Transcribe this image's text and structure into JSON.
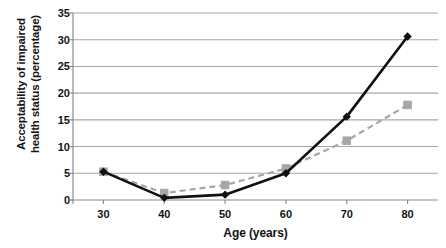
{
  "chart_data": {
    "type": "line",
    "title": "",
    "xlabel": "Age (years)",
    "ylabel_line1": "Acceptability of impaired",
    "ylabel_line2": "health status (percentage)",
    "x": [
      30,
      40,
      50,
      60,
      70,
      80
    ],
    "xticklabels": [
      "30",
      "40",
      "50",
      "60",
      "70",
      "80"
    ],
    "yticklabels": [
      "0",
      "5",
      "10",
      "15",
      "20",
      "25",
      "30",
      "35"
    ],
    "yticks": [
      0,
      5,
      10,
      15,
      20,
      25,
      30,
      35
    ],
    "xlim": [
      25,
      85
    ],
    "ylim": [
      0,
      35
    ],
    "grid": "horizontal",
    "legend": "none",
    "series": [
      {
        "name": "black-solid-diamond",
        "values": [
          5.3,
          0.4,
          1.0,
          5.0,
          15.6,
          30.6
        ],
        "color": "#111111",
        "linestyle": "solid",
        "marker": "diamond"
      },
      {
        "name": "gray-dashed-square",
        "values": [
          5.3,
          1.3,
          2.8,
          5.9,
          11.1,
          17.8
        ],
        "color": "#a6a6a6",
        "linestyle": "dashed",
        "marker": "square"
      }
    ],
    "colors": {
      "grid": "#a8a8a8",
      "axis": "#8c8c8c",
      "text": "#131313",
      "series_black": "#111111",
      "series_gray": "#a6a6a6"
    }
  }
}
